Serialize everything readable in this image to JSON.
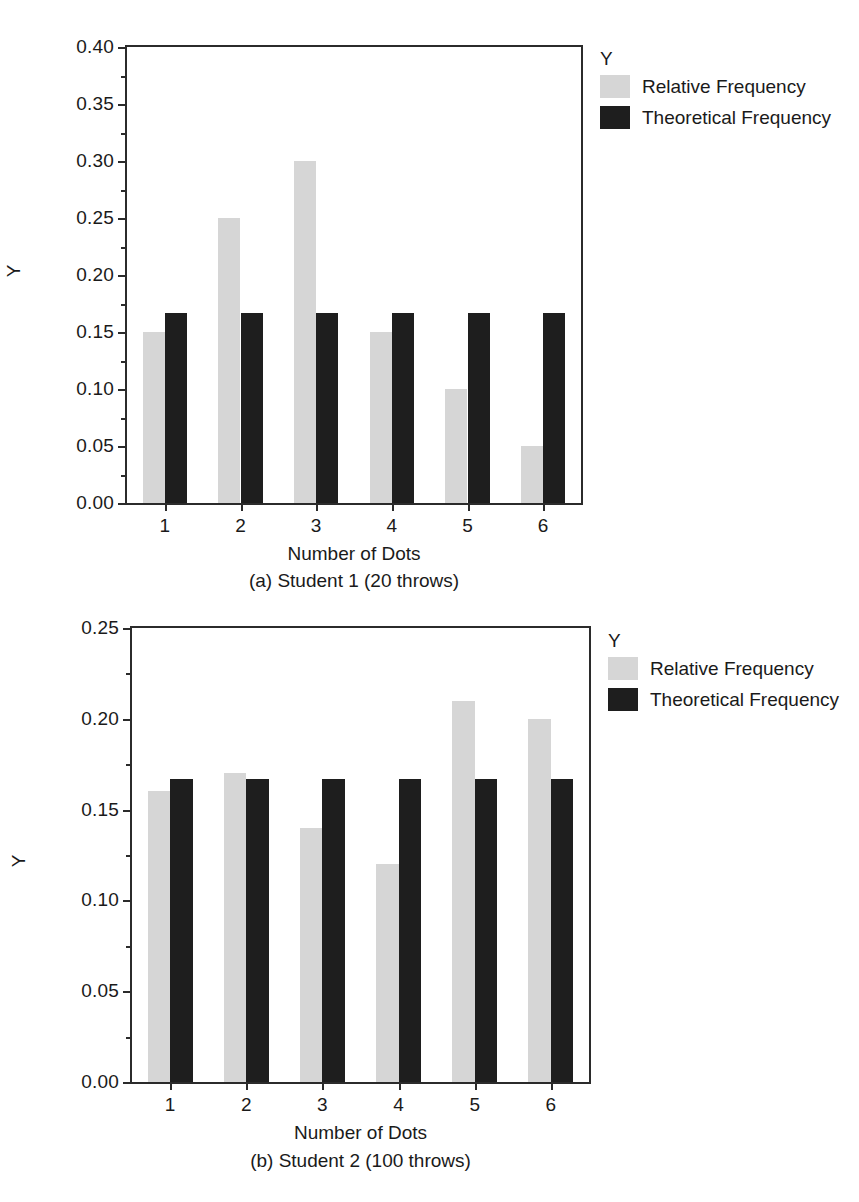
{
  "figures": [
    {
      "id": "a",
      "caption": "(a) Student 1 (20 throws)",
      "chart_data": {
        "type": "bar",
        "title": "",
        "xlabel": "Number of Dots",
        "ylabel": "Y",
        "categories": [
          "1",
          "2",
          "3",
          "4",
          "5",
          "6"
        ],
        "series": [
          {
            "name": "Relative Frequency",
            "color": "#d6d6d6",
            "values": [
              0.15,
              0.25,
              0.3,
              0.15,
              0.1,
              0.05
            ]
          },
          {
            "name": "Theoretical Frequency",
            "color": "#1e1e1e",
            "values": [
              0.167,
              0.167,
              0.167,
              0.167,
              0.167,
              0.167
            ]
          }
        ],
        "ylim": [
          0.0,
          0.4
        ],
        "ytick_labels": [
          "0.00",
          "0.05",
          "0.10",
          "0.15",
          "0.20",
          "0.25",
          "0.30",
          "0.35",
          "0.40"
        ],
        "ytick_values": [
          0.0,
          0.05,
          0.1,
          0.15,
          0.2,
          0.25,
          0.3,
          0.35,
          0.4
        ],
        "yminor_values": [
          0.025,
          0.075,
          0.125,
          0.175,
          0.225,
          0.275,
          0.325,
          0.375
        ],
        "grid": false,
        "legend_position": "right",
        "legend_title": "Y"
      }
    },
    {
      "id": "b",
      "caption": "(b) Student 2 (100 throws)",
      "chart_data": {
        "type": "bar",
        "title": "",
        "xlabel": "Number of Dots",
        "ylabel": "Y",
        "categories": [
          "1",
          "2",
          "3",
          "4",
          "5",
          "6"
        ],
        "series": [
          {
            "name": "Relative Frequency",
            "color": "#d6d6d6",
            "values": [
              0.16,
              0.17,
              0.14,
              0.12,
              0.21,
              0.2
            ]
          },
          {
            "name": "Theoretical Frequency",
            "color": "#1e1e1e",
            "values": [
              0.167,
              0.167,
              0.167,
              0.167,
              0.167,
              0.167
            ]
          }
        ],
        "ylim": [
          0.0,
          0.25
        ],
        "ytick_labels": [
          "0.00",
          "0.05",
          "0.10",
          "0.15",
          "0.20",
          "0.25"
        ],
        "ytick_values": [
          0.0,
          0.05,
          0.1,
          0.15,
          0.2,
          0.25
        ],
        "yminor_values": [
          0.025,
          0.075,
          0.125,
          0.175,
          0.225
        ],
        "grid": false,
        "legend_position": "right",
        "legend_title": "Y"
      }
    }
  ]
}
